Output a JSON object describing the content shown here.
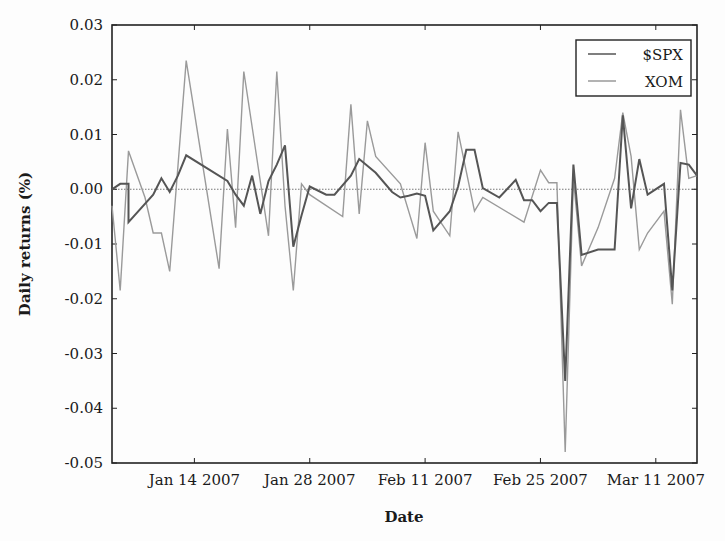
{
  "chart_data": {
    "type": "line",
    "title": "",
    "xlabel": "Date",
    "ylabel": "Daily returns (%)",
    "ylim": [
      -0.05,
      0.03
    ],
    "xlim": [
      "2007-01-04",
      "2007-03-16"
    ],
    "grid": false,
    "legend": "top-right",
    "yticks": [
      -0.05,
      -0.04,
      -0.03,
      -0.02,
      -0.01,
      0.0,
      0.01,
      0.02,
      0.03
    ],
    "ytick_labels": [
      "-0.05",
      "-0.04",
      "-0.03",
      "-0.02",
      "-0.01",
      "0.00",
      "0.01",
      "0.02",
      "0.03"
    ],
    "xticks": [
      "2007-01-14",
      "2007-01-28",
      "2007-02-11",
      "2007-02-25",
      "2007-03-11"
    ],
    "xtick_labels": [
      "Jan 14 2007",
      "Jan 28 2007",
      "Feb 11 2007",
      "Feb 25 2007",
      "Mar 11 2007"
    ],
    "reference_line": {
      "y": 0.0,
      "style": "dotted"
    },
    "series": [
      {
        "name": "$SPX",
        "color": "#555555",
        "points": [
          [
            "2007-01-04",
            0.0
          ],
          [
            "2007-01-05",
            0.001
          ],
          [
            "2007-01-06",
            0.001
          ],
          [
            "2007-01-06",
            -0.006
          ],
          [
            "2007-01-09",
            -0.001
          ],
          [
            "2007-01-10",
            0.002
          ],
          [
            "2007-01-11",
            -0.0005
          ],
          [
            "2007-01-12",
            0.0025
          ],
          [
            "2007-01-13",
            0.0062
          ],
          [
            "2007-01-18",
            0.0015
          ],
          [
            "2007-01-19",
            -0.001
          ],
          [
            "2007-01-20",
            -0.003
          ],
          [
            "2007-01-21",
            0.0025
          ],
          [
            "2007-01-22",
            -0.0045
          ],
          [
            "2007-01-23",
            0.0015
          ],
          [
            "2007-01-24",
            0.0045
          ],
          [
            "2007-01-25",
            0.008
          ],
          [
            "2007-01-26",
            -0.0105
          ],
          [
            "2007-01-27",
            -0.0048
          ],
          [
            "2007-01-28",
            0.0005
          ],
          [
            "2007-01-30",
            -0.001
          ],
          [
            "2007-01-31",
            -0.001
          ],
          [
            "2007-02-02",
            0.0025
          ],
          [
            "2007-02-03",
            0.0055
          ],
          [
            "2007-02-05",
            0.003
          ],
          [
            "2007-02-07",
            -0.0005
          ],
          [
            "2007-02-08",
            -0.0015
          ],
          [
            "2007-02-09",
            -0.0012
          ],
          [
            "2007-02-10",
            -0.0008
          ],
          [
            "2007-02-11",
            -0.0012
          ],
          [
            "2007-02-12",
            -0.0075
          ],
          [
            "2007-02-14",
            -0.004
          ],
          [
            "2007-02-15",
            0.0005
          ],
          [
            "2007-02-16",
            0.0072
          ],
          [
            "2007-02-17",
            0.0072
          ],
          [
            "2007-02-18",
            0.0002
          ],
          [
            "2007-02-20",
            -0.0015
          ],
          [
            "2007-02-22",
            0.0017
          ],
          [
            "2007-02-23",
            -0.002
          ],
          [
            "2007-02-24",
            -0.002
          ],
          [
            "2007-02-25",
            -0.004
          ],
          [
            "2007-02-26",
            -0.0025
          ],
          [
            "2007-02-27",
            -0.0025
          ],
          [
            "2007-02-28",
            -0.035
          ],
          [
            "2007-03-01",
            0.0045
          ],
          [
            "2007-03-02",
            -0.012
          ],
          [
            "2007-03-04",
            -0.011
          ],
          [
            "2007-03-06",
            -0.011
          ],
          [
            "2007-03-07",
            0.0135
          ],
          [
            "2007-03-08",
            -0.0035
          ],
          [
            "2007-03-09",
            0.0055
          ],
          [
            "2007-03-10",
            -0.001
          ],
          [
            "2007-03-12",
            0.001
          ],
          [
            "2007-03-13",
            -0.0185
          ],
          [
            "2007-03-14",
            0.0048
          ],
          [
            "2007-03-15",
            0.0045
          ],
          [
            "2007-03-16",
            0.0025
          ]
        ]
      },
      {
        "name": "XOM",
        "color": "#9a9a9a",
        "points": [
          [
            "2007-01-04",
            -0.003
          ],
          [
            "2007-01-05",
            -0.0185
          ],
          [
            "2007-01-06",
            0.007
          ],
          [
            "2007-01-08",
            -0.0015
          ],
          [
            "2007-01-09",
            -0.008
          ],
          [
            "2007-01-10",
            -0.008
          ],
          [
            "2007-01-11",
            -0.015
          ],
          [
            "2007-01-13",
            0.0235
          ],
          [
            "2007-01-17",
            -0.0145
          ],
          [
            "2007-01-18",
            0.011
          ],
          [
            "2007-01-19",
            -0.007
          ],
          [
            "2007-01-20",
            0.0215
          ],
          [
            "2007-01-23",
            -0.0085
          ],
          [
            "2007-01-24",
            0.0215
          ],
          [
            "2007-01-25",
            -0.003
          ],
          [
            "2007-01-26",
            -0.0185
          ],
          [
            "2007-01-27",
            0.001
          ],
          [
            "2007-01-28",
            -0.001
          ],
          [
            "2007-02-01",
            -0.005
          ],
          [
            "2007-02-02",
            0.0155
          ],
          [
            "2007-02-03",
            -0.0045
          ],
          [
            "2007-02-04",
            0.0125
          ],
          [
            "2007-02-05",
            0.006
          ],
          [
            "2007-02-08",
            0.001
          ],
          [
            "2007-02-10",
            -0.009
          ],
          [
            "2007-02-11",
            0.0085
          ],
          [
            "2007-02-12",
            -0.004
          ],
          [
            "2007-02-14",
            -0.0085
          ],
          [
            "2007-02-15",
            0.0105
          ],
          [
            "2007-02-17",
            -0.004
          ],
          [
            "2007-02-18",
            -0.0015
          ],
          [
            "2007-02-23",
            -0.006
          ],
          [
            "2007-02-25",
            0.0035
          ],
          [
            "2007-02-26",
            0.0012
          ],
          [
            "2007-02-27",
            0.0012
          ],
          [
            "2007-02-28",
            -0.048
          ],
          [
            "2007-03-01",
            0.002
          ],
          [
            "2007-03-02",
            -0.014
          ],
          [
            "2007-03-04",
            -0.007
          ],
          [
            "2007-03-06",
            0.002
          ],
          [
            "2007-03-07",
            0.014
          ],
          [
            "2007-03-08",
            0.006
          ],
          [
            "2007-03-09",
            -0.011
          ],
          [
            "2007-03-10",
            -0.008
          ],
          [
            "2007-03-12",
            -0.004
          ],
          [
            "2007-03-13",
            -0.021
          ],
          [
            "2007-03-14",
            0.0145
          ],
          [
            "2007-03-15",
            0.002
          ],
          [
            "2007-03-16",
            0.0025
          ]
        ]
      }
    ]
  }
}
